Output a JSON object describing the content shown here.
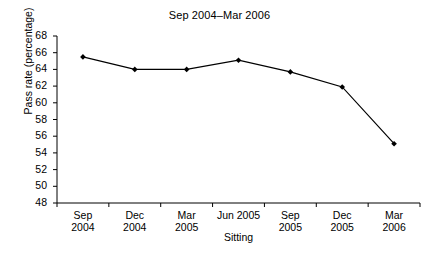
{
  "chart_data": {
    "type": "line",
    "title": "Sep 2004–Mar 2006",
    "xlabel": "Sitting",
    "ylabel": "Pass rate (percentage)",
    "categories": [
      "Sep\n2004",
      "Dec\n2004",
      "Mar\n2005",
      "Jun 2005",
      "Sep\n2005",
      "Dec\n2005",
      "Mar\n2006"
    ],
    "category_labels": [
      {
        "line1": "Sep",
        "line2": "2004"
      },
      {
        "line1": "Dec",
        "line2": "2004"
      },
      {
        "line1": "Mar",
        "line2": "2005"
      },
      {
        "line1": "Jun 2005",
        "line2": ""
      },
      {
        "line1": "Sep",
        "line2": "2005"
      },
      {
        "line1": "Dec",
        "line2": "2005"
      },
      {
        "line1": "Mar",
        "line2": "2006"
      }
    ],
    "values": [
      65.5,
      64.0,
      64.0,
      65.1,
      63.7,
      61.9,
      55.1
    ],
    "ylim": [
      48,
      68
    ],
    "ytick_labels": [
      "68",
      "66",
      "64",
      "62",
      "60",
      "58",
      "56",
      "54",
      "52",
      "50",
      "48"
    ],
    "ytick_values": [
      68,
      66,
      64,
      62,
      60,
      58,
      56,
      54,
      52,
      50,
      48
    ],
    "grid": false,
    "legend": "none",
    "series_color": "#000000",
    "marker": "diamond",
    "background": "#ffffff"
  }
}
